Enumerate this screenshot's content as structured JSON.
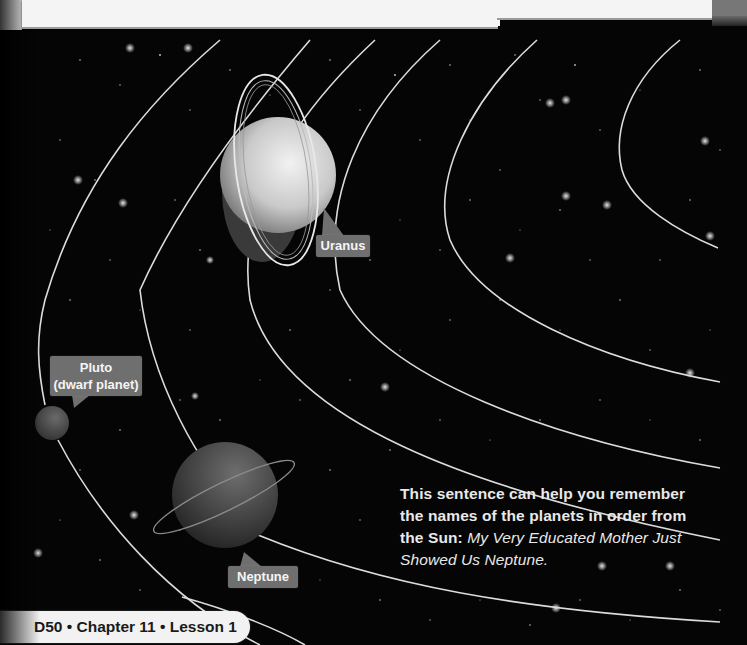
{
  "labels": {
    "uranus": "Uranus",
    "neptune": "Neptune",
    "pluto_line1": "Pluto",
    "pluto_line2": "(dwarf planet)"
  },
  "caption": {
    "bold": "This sentence can help you remember the names of the planets in order from the Sun:",
    "italic": "My Very Educated Mother Just Showed Us Neptune."
  },
  "footer": {
    "text": "D50 • Chapter 11 • Lesson 1"
  },
  "colors": {
    "background": "#050505",
    "orbit": "#dcdcdc",
    "callout": "#6f6f6f",
    "footer_bg": "#f2f2f2",
    "top_panel": "#f4f4f4"
  }
}
